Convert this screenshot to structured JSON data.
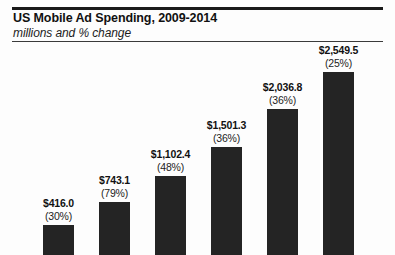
{
  "chart_data": {
    "type": "bar",
    "title": "US Mobile Ad Spending, 2009-2014",
    "subtitle": "millions and % change",
    "xlabel": "",
    "ylabel": "",
    "grid": false,
    "legend": "none",
    "ylim": [
      0,
      2700
    ],
    "categories": [
      "2009",
      "2010",
      "2011",
      "2012",
      "2013",
      "2014"
    ],
    "values": [
      416.0,
      743.1,
      1102.4,
      1501.3,
      2036.8,
      2549.5
    ],
    "value_labels": [
      "$416.0",
      "$743.1",
      "$1,102.4",
      "$1,501.3",
      "$2,036.8",
      "$2,549.5"
    ],
    "change_labels": [
      "(30%)",
      "(79%)",
      "(48%)",
      "(36%)",
      "(36%)",
      "(25%)"
    ],
    "percent_change": [
      30,
      79,
      48,
      36,
      36,
      25
    ],
    "bar_color": "#242424",
    "series": [
      {
        "name": "US Mobile Ad Spending",
        "values": [
          416.0,
          743.1,
          1102.4,
          1501.3,
          2036.8,
          2549.5
        ]
      }
    ]
  },
  "bars": [
    {
      "value_label": "$416.0",
      "change_label": "(30%)"
    },
    {
      "value_label": "$743.1",
      "change_label": "(79%)"
    },
    {
      "value_label": "$1,102.4",
      "change_label": "(48%)"
    },
    {
      "value_label": "$1,501.3",
      "change_label": "(36%)"
    },
    {
      "value_label": "$2,036.8",
      "change_label": "(36%)"
    },
    {
      "value_label": "$2,549.5",
      "change_label": "(25%)"
    }
  ]
}
